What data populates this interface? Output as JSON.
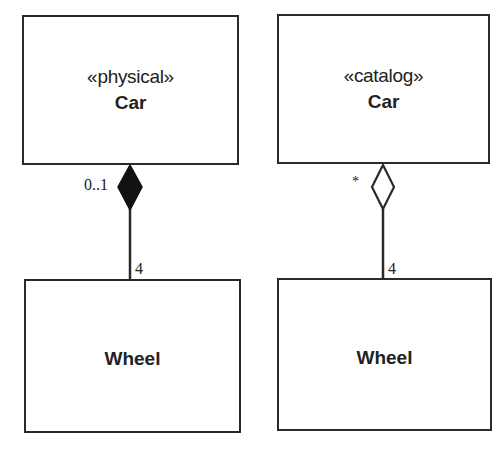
{
  "diagram": {
    "type": "UML class diagram",
    "left_model": {
      "whole": {
        "stereotype": "«physical»",
        "name": "Car"
      },
      "part": {
        "name": "Wheel"
      },
      "association": {
        "kind": "composition",
        "whole_multiplicity": "0..1",
        "part_multiplicity": "4"
      }
    },
    "right_model": {
      "whole": {
        "stereotype": "«catalog»",
        "name": "Car"
      },
      "part": {
        "name": "Wheel"
      },
      "association": {
        "kind": "aggregation",
        "whole_multiplicity": "*",
        "part_multiplicity": "4"
      }
    },
    "colors": {
      "line": "#2a2a2a",
      "filled_diamond": "#111111",
      "hollow_diamond_fill": "#ffffff",
      "background": "#ffffff"
    }
  }
}
